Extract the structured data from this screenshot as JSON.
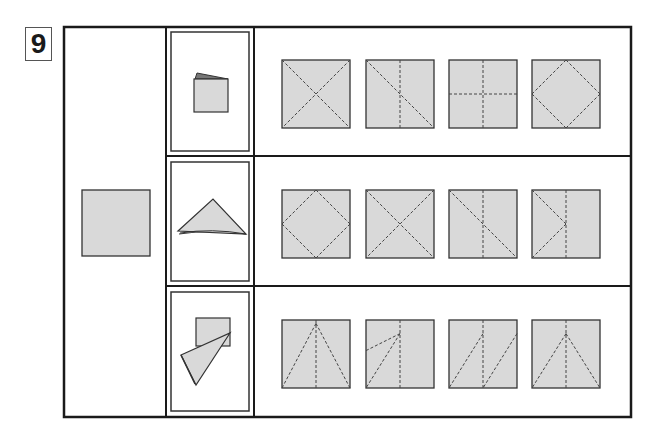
{
  "puzzle": {
    "number": "9",
    "start_shape": "plain-square",
    "colors": {
      "paper": "#d9d9d9",
      "stroke": "#333333",
      "fold_line": "#444444",
      "frame": "#1a1a1a"
    },
    "rows": [
      {
        "folded_result": "square-folded-book",
        "options": [
          {
            "id": "r1-o1",
            "creases": [
              "diag-main",
              "diag-anti"
            ]
          },
          {
            "id": "r1-o2",
            "creases": [
              "diag-main",
              "vertical-center"
            ]
          },
          {
            "id": "r1-o3",
            "creases": [
              "vertical-center",
              "horizontal-center"
            ]
          },
          {
            "id": "r1-o4",
            "creases": [
              "diamond"
            ]
          }
        ]
      },
      {
        "folded_result": "triangle-folded",
        "options": [
          {
            "id": "r2-o1",
            "creases": [
              "diamond"
            ]
          },
          {
            "id": "r2-o2",
            "creases": [
              "diag-main",
              "diag-anti"
            ]
          },
          {
            "id": "r2-o3",
            "creases": [
              "diag-main",
              "vertical-center"
            ]
          },
          {
            "id": "r2-o4",
            "creases": [
              "left-chevron",
              "vertical-center"
            ]
          }
        ]
      },
      {
        "folded_result": "twisted-flap",
        "options": [
          {
            "id": "r3-o1",
            "creases": [
              "top-peak-full",
              "vertical-center"
            ]
          },
          {
            "id": "r3-o2",
            "creases": [
              "upper-fan",
              "vertical-center"
            ]
          },
          {
            "id": "r3-o3",
            "creases": [
              "double-slash",
              "vertical-center"
            ]
          },
          {
            "id": "r3-o4",
            "creases": [
              "top-peak-inset",
              "vertical-center"
            ]
          }
        ]
      }
    ]
  }
}
